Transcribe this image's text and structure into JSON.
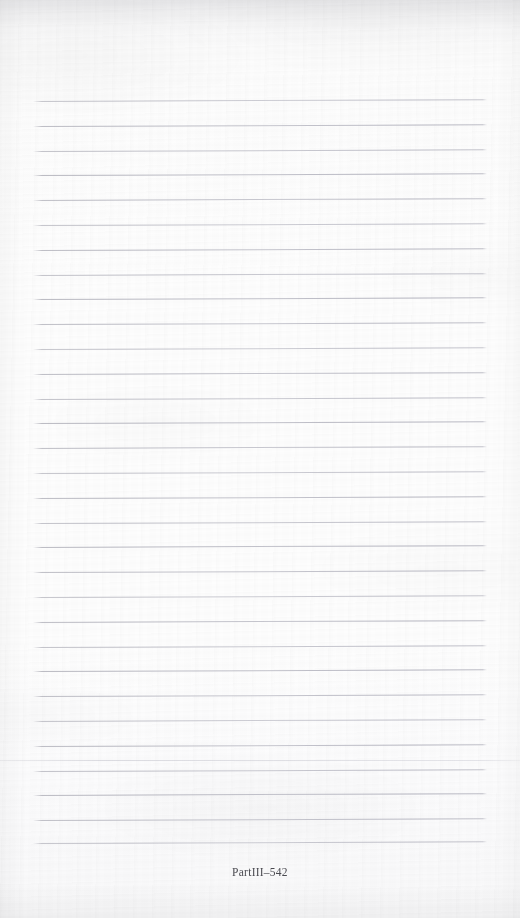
{
  "page": {
    "kind": "scanned-blank-ruled-notebook-page",
    "width": 520,
    "height": 918,
    "paper_color": "#fbfbfc",
    "rule_color": "#b0b0ba",
    "text_color": "#4a4a50"
  },
  "footer": {
    "folio": "PartIII–542",
    "x": 260,
    "y": 874
  },
  "ruled_lines": {
    "count": 31,
    "first_y": 101,
    "spacing": 24.8,
    "x_start": 33,
    "x_end": 487,
    "skew_deg": -0.22,
    "y_positions": [
      101,
      125.8,
      150.6,
      175.4,
      200.2,
      225,
      249.8,
      274.6,
      299.4,
      324.2,
      349,
      373.8,
      398.6,
      423.4,
      448.2,
      473,
      497.8,
      522.6,
      547.4,
      572.2,
      597,
      621.8,
      646.6,
      671.4,
      696.2,
      721,
      745.8,
      770.6,
      795.4,
      820.2,
      843
    ]
  },
  "artifacts": {
    "seam_lines": [
      {
        "y": 760,
        "label": "scan-seam-upper"
      }
    ]
  }
}
